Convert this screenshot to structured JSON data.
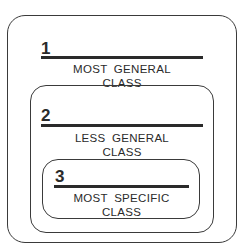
{
  "diagram": {
    "levels": [
      {
        "number": "1",
        "line1": "MOST GENERAL",
        "line2": "CLASS"
      },
      {
        "number": "2",
        "line1": "LESS GENERAL",
        "line2": "CLASS"
      },
      {
        "number": "3",
        "line1": "MOST SPECIFIC",
        "line2": "CLASS"
      }
    ]
  }
}
